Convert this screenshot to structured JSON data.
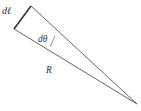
{
  "diagram": {
    "labels": {
      "arc_length": "dℓ",
      "angle": "dθ",
      "radius": "R"
    },
    "colors": {
      "stroke": "#444444",
      "text": "#333333",
      "background": "#ffffff"
    }
  }
}
